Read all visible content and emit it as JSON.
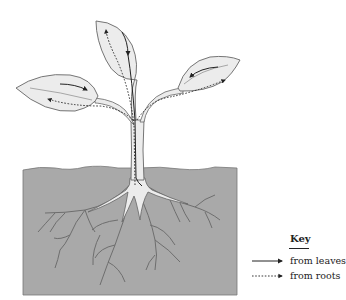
{
  "diagram": {
    "soil_color": "#a9a9a9",
    "leaf_fill": "#ececec",
    "stroke_color": "#555555",
    "arrow_color": "#222222"
  },
  "key": {
    "title": "Key",
    "items": [
      {
        "line_style": "solid",
        "label": "from leaves"
      },
      {
        "line_style": "dotted",
        "label": "from roots"
      }
    ]
  }
}
